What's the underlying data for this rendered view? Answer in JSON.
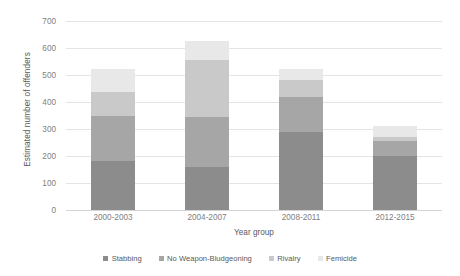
{
  "chart_data": {
    "type": "bar",
    "subtype": "stacked-bar",
    "title": "",
    "xlabel": "Year group",
    "ylabel": "Estimated number of offenders",
    "categories": [
      "2000-2003",
      "2004-2007",
      "2008-2011",
      "2012-2015"
    ],
    "series": [
      {
        "name": "Stabbing",
        "color": "#8c8c8c",
        "values": [
          180,
          160,
          290,
          200
        ]
      },
      {
        "name": "No Weapon-Bludgeoning",
        "color": "#a6a6a6",
        "values": [
          170,
          185,
          130,
          55
        ]
      },
      {
        "name": "Rivalry",
        "color": "#c9c9c9",
        "values": [
          87,
          212,
          60,
          17
        ]
      },
      {
        "name": "Femicide",
        "color": "#e8e8e8",
        "values": [
          85,
          69,
          42,
          38
        ]
      }
    ],
    "totals": [
      522,
      626,
      522,
      310
    ],
    "ylim": [
      0,
      700
    ],
    "yticks": [
      0,
      100,
      200,
      300,
      400,
      500,
      600,
      700
    ],
    "ytick_labels": [
      "0",
      "100",
      "200",
      "300",
      "400",
      "500",
      "600",
      "700"
    ],
    "grid": true,
    "legend_position": "bottom",
    "gridline_color": "#e4e4e4",
    "text_color": "#595959"
  }
}
